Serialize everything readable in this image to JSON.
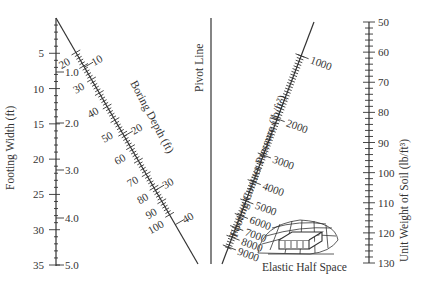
{
  "diagram": {
    "type": "nomograph",
    "axes": {
      "footing_width": {
        "title": "Footing Width (ft)",
        "labels": [
          "5",
          "10",
          "15",
          "20",
          "25",
          "30",
          "35"
        ],
        "secondary_labels": [
          "1.0",
          "2.0",
          "3.0",
          "4.0",
          "5.0"
        ]
      },
      "boring_depth": {
        "title": "Boring Depth (ft)",
        "inner_labels": [
          "20",
          "30",
          "40",
          "50",
          "60",
          "70",
          "80",
          "90",
          "100"
        ],
        "outer_labels": [
          "10",
          "20",
          "30",
          "40"
        ]
      },
      "pivot": {
        "title": "Pivot Line"
      },
      "contact_pressure": {
        "title": "Footing Contact Pressure (lb/ft²)",
        "labels": [
          "1000",
          "2000",
          "3000",
          "4000",
          "5000",
          "6000",
          "7000",
          "8000",
          "9000"
        ]
      },
      "unit_weight": {
        "title": "Unit Weight of Soil (lb/ft³)",
        "labels": [
          "50",
          "60",
          "70",
          "80",
          "90",
          "100",
          "110",
          "120",
          "130"
        ]
      }
    },
    "figure_caption": "Elastic Half Space"
  }
}
